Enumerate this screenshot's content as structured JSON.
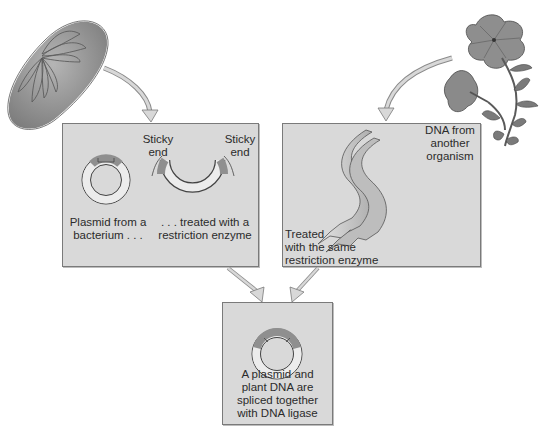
{
  "diagram": {
    "sources": {
      "bacterium": {
        "icon": "bacterium-icon"
      },
      "plant": {
        "icon": "petunia-flower-icon"
      }
    },
    "panels": {
      "left": {
        "plasmid_caption": "Plasmid from a bacterium . . .",
        "plasmid_caption_line1": "Plasmid from a",
        "plasmid_caption_line2": "bacterium . . .",
        "cut_caption_line1": ". . . treated with a",
        "cut_caption_line2": "restriction enzyme",
        "sticky_end_left_line1": "Sticky",
        "sticky_end_left_line2": "end",
        "sticky_end_right_line1": "Sticky",
        "sticky_end_right_line2": "end"
      },
      "right": {
        "dna_source_line1": "DNA from",
        "dna_source_line2": "another",
        "dna_source_line3": "organism",
        "treated_line1": "Treated",
        "treated_line2": "with the same",
        "treated_line3": "restriction enzyme"
      },
      "bottom": {
        "result_line1": "A plasmid and",
        "result_line2": "plant DNA are",
        "result_line3": "spliced together",
        "result_line4": "with DNA ligase"
      }
    },
    "colors": {
      "panel_fill": "#d9d9d9",
      "panel_border": "#7a7a7a",
      "ring_fill": "#eeeeee",
      "ring_dark": "#8f8f8f",
      "arrow_fill": "#cfcfcf"
    }
  }
}
